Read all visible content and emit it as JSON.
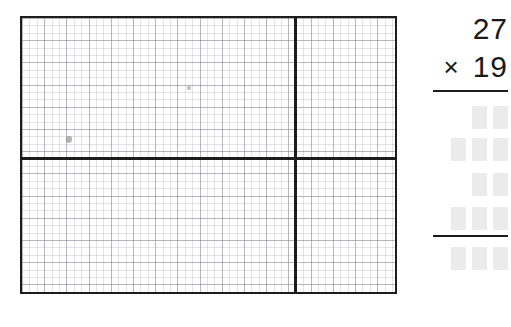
{
  "worksheet": {
    "grid": {
      "name": "graph-paper-quadrant-grid",
      "description": "blank graph paper divided into four quadrants",
      "marks": [
        {
          "label": "pencil-smudge"
        },
        {
          "label": "pencil-dot"
        }
      ]
    },
    "problem": {
      "type": "long-multiplication",
      "multiplicand": "27",
      "multiplier": "19",
      "operator": "×",
      "answer_rows": [
        {
          "label": "partial-product-carry",
          "boxes": 2
        },
        {
          "label": "partial-product-first",
          "boxes": 3
        },
        {
          "label": "partial-product-carry-2",
          "boxes": 2
        },
        {
          "label": "partial-product-second",
          "boxes": 3
        },
        {
          "label": "final-product",
          "boxes": 3
        }
      ],
      "box_placeholder": ""
    },
    "colors": {
      "ink": "#1c1c1c",
      "box_fill": "#ebebeb",
      "grid_major": "#78788 7",
      "paper": "#ffffff"
    }
  }
}
